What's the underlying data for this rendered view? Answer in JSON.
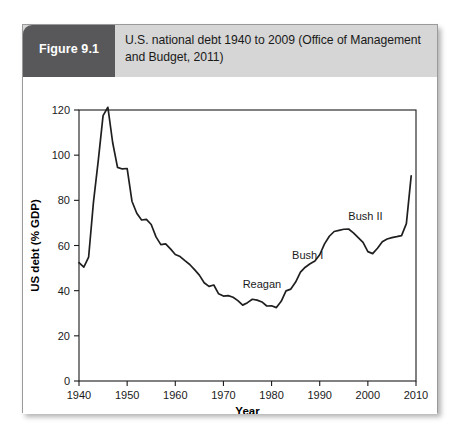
{
  "figure": {
    "badge_label": "Figure 9.1",
    "caption": "U.S. national debt 1940 to 2009 (Office of Management and Budget, 2011)",
    "badge_color": "#58585a",
    "header_color": "#d6d6d6"
  },
  "chart_data": {
    "type": "line",
    "title": "",
    "xlabel": "Year",
    "ylabel": "US debt (% GDP)",
    "xlim": [
      1940,
      2010
    ],
    "ylim": [
      0,
      120
    ],
    "xticks": [
      1940,
      1950,
      1960,
      1970,
      1980,
      1990,
      2000,
      2010
    ],
    "yticks": [
      0,
      20,
      40,
      60,
      80,
      100,
      120
    ],
    "grid": false,
    "legend": "none",
    "line_color": "#1f1f1f",
    "series": [
      {
        "name": "US debt (% GDP)",
        "x": [
          1940,
          1941,
          1942,
          1943,
          1944,
          1945,
          1946,
          1947,
          1948,
          1949,
          1950,
          1951,
          1952,
          1953,
          1954,
          1955,
          1956,
          1957,
          1958,
          1959,
          1960,
          1961,
          1962,
          1963,
          1964,
          1965,
          1966,
          1967,
          1968,
          1969,
          1970,
          1971,
          1972,
          1973,
          1974,
          1975,
          1976,
          1977,
          1978,
          1979,
          1980,
          1981,
          1982,
          1983,
          1984,
          1985,
          1986,
          1987,
          1988,
          1989,
          1990,
          1991,
          1992,
          1993,
          1994,
          1995,
          1996,
          1997,
          1998,
          1999,
          2000,
          2001,
          2002,
          2003,
          2004,
          2005,
          2006,
          2007,
          2008,
          2009
        ],
        "values": [
          52.4,
          50.4,
          54.9,
          79.1,
          97.6,
          117.5,
          121.2,
          105.5,
          94.6,
          93.9,
          94.1,
          79.6,
          74.3,
          71.3,
          71.6,
          69.3,
          63.8,
          60.4,
          60.7,
          58.5,
          56.0,
          55.1,
          53.3,
          51.6,
          49.3,
          46.9,
          43.5,
          41.9,
          42.5,
          38.6,
          37.6,
          37.8,
          37.1,
          35.6,
          33.6,
          34.7,
          36.2,
          35.8,
          35.0,
          33.2,
          33.3,
          32.5,
          35.3,
          39.9,
          40.7,
          43.8,
          48.2,
          50.4,
          51.9,
          53.1,
          55.9,
          60.7,
          64.1,
          66.2,
          66.7,
          67.2,
          67.3,
          65.6,
          63.5,
          61.4,
          57.3,
          56.4,
          58.8,
          61.7,
          62.9,
          63.5,
          63.9,
          64.4,
          69.7,
          90.8
        ]
      }
    ],
    "annotations": [
      {
        "label": "Reagan",
        "x": 1978.0,
        "y": 41.0
      },
      {
        "label": "Bush I",
        "x": 1987.5,
        "y": 54.0
      },
      {
        "label": "Bush II",
        "x": 1999.5,
        "y": 71.5
      }
    ]
  }
}
